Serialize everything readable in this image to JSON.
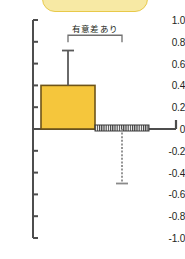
{
  "banner": {
    "label": "",
    "fill_color": "#f7e9a4",
    "border_color": "#e8c949"
  },
  "chart_data": {
    "type": "bar",
    "title": "",
    "subtitle": "",
    "xlabel": "",
    "ylabel": "",
    "ylim": [
      -1.0,
      1.0
    ],
    "grid": false,
    "legend": null,
    "categories": [
      "",
      ""
    ],
    "values": [
      0.4,
      0.0
    ],
    "errors_upper": [
      0.32,
      0.0
    ],
    "errors_lower": [
      0.0,
      0.5
    ],
    "error_bar_tops": [
      0.72,
      0.0
    ],
    "error_bar_bottoms": [
      0.4,
      -0.5
    ],
    "bar_styles": [
      "solid",
      "hatched"
    ],
    "bar_colors": [
      "#f5c63c",
      "#ffffff"
    ],
    "bar_edge_colors": [
      "#6e5418",
      "#3a3a3a"
    ],
    "yticks": [
      1.0,
      0.8,
      0.6,
      0.4,
      0.2,
      0,
      -0.2,
      -0.4,
      -0.6,
      -0.8,
      -1.0
    ],
    "ytick_labels": [
      "1.0",
      "0.8",
      "0.6",
      "0.4",
      "0.2",
      "0",
      "-0.2",
      "-0.4",
      "-0.6",
      "-0.8",
      "-1.0"
    ],
    "annotations": [
      {
        "text": "有意差あり",
        "type": "significance-bracket",
        "from_category": 0,
        "to_category": 1,
        "y": 0.86
      }
    ],
    "axis_color": "#4d4d4d"
  }
}
